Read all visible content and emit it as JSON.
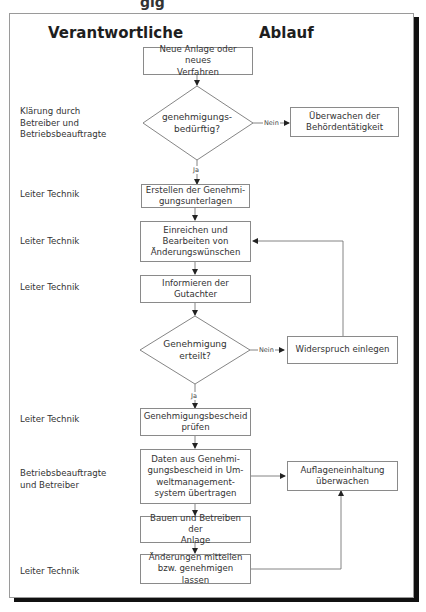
{
  "top_fragment": "gig",
  "headers": {
    "responsible": "Verantwortliche",
    "process": "Ablauf"
  },
  "responsibles": [
    {
      "text": "Klärung durch\nBetreiber und\nBetriebsbeauftragte"
    },
    {
      "text": "Leiter Technik"
    },
    {
      "text": "Leiter Technik"
    },
    {
      "text": "Leiter Technik"
    },
    {
      "text": "Leiter Technik"
    },
    {
      "text": "Betriebsbeauftragte\nund Betreiber"
    },
    {
      "text": "Leiter Technik"
    }
  ],
  "steps": {
    "start": "Neue Anlage oder neues\nVerfahren",
    "decision1": "genehmigungs-\nbedürftig?",
    "monitor_authority": "Überwachen der\nBehördentätigkeit",
    "create_docs": "Erstellen der Genehmi-\ngungsunterlagen",
    "submit": "Einreichen und\nBearbeiten von\nÄnderungswünschen",
    "inform": "Informieren der\nGutachter",
    "decision2": "Genehmigung\nerteilt?",
    "objection": "Widerspruch einlegen",
    "check_notice": "Genehmigungsbescheid\nprüfen",
    "transfer_data": "Daten aus Genehmi-\ngungsbescheid in Um-\nweltmanagement-\nsystem übertragen",
    "monitor_conditions": "Auflageneinhaltung\nüberwachen",
    "build_operate": "Bauen und Betreiben der\nAnlage",
    "report_changes": "Änderungen mitteilen\nbzw. genehmigen lassen"
  },
  "edge_labels": {
    "no1": "Nein",
    "yes1": "Ja",
    "no2": "Nein",
    "yes2": "Ja"
  }
}
